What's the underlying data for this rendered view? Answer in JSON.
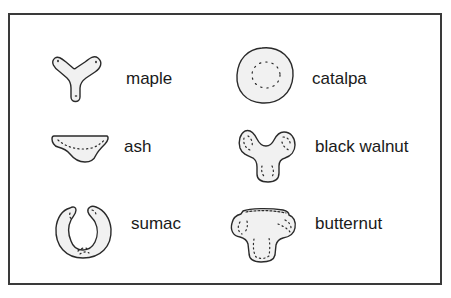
{
  "items": [
    {
      "id": "maple",
      "label": "maple",
      "shape_icon": "maple-leaf-scar-icon"
    },
    {
      "id": "catalpa",
      "label": "catalpa",
      "shape_icon": "catalpa-leaf-scar-icon"
    },
    {
      "id": "ash",
      "label": "ash",
      "shape_icon": "ash-leaf-scar-icon"
    },
    {
      "id": "black-walnut",
      "label": "black walnut",
      "shape_icon": "black-walnut-leaf-scar-icon"
    },
    {
      "id": "sumac",
      "label": "sumac",
      "shape_icon": "sumac-leaf-scar-icon"
    },
    {
      "id": "butternut",
      "label": "butternut",
      "shape_icon": "butternut-leaf-scar-icon"
    }
  ],
  "colors": {
    "outline": "#2a2a2a",
    "fill": "#f1f1f1",
    "frame": "#3a3a3a"
  }
}
